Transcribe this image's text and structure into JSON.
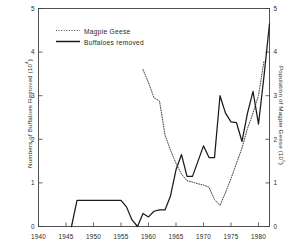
{
  "figure": {
    "background": "#ffffff",
    "frame_color": "#3a3a3a"
  },
  "legend": {
    "geese_label": "Magpie  Geese",
    "buffalo_label": "Buffaloes   removed",
    "geese_style": "dotted",
    "buffalo_style": "solid"
  },
  "axes": {
    "x_ticks": [
      "1940",
      "1945",
      "1950",
      "1955",
      "1960",
      "1965",
      "1970",
      "1975",
      "1980"
    ],
    "y_left_ticks": [
      "0",
      "1",
      "2",
      "3",
      "4",
      "5"
    ],
    "y_right_ticks": [
      "0",
      "1",
      "2",
      "3",
      "4",
      "5"
    ],
    "y_left_title_main": "Numbers  of  Buffaloes  Removed   (10",
    "y_left_title_exp": "4",
    "y_left_title_tail": ")",
    "y_right_title_main": "Population  of  Magpie  Geese   (10",
    "y_right_title_exp": "5",
    "y_right_title_tail": ")"
  },
  "chart_data": {
    "type": "line",
    "title": "",
    "xlabel": "",
    "ylabel": "Numbers of Buffaloes Removed (10^4)",
    "ylabel_right": "Population of Magpie Geese (10^5)",
    "xlim": [
      1940,
      1982
    ],
    "ylim": [
      0,
      5
    ],
    "ylim_right": [
      0,
      5
    ],
    "grid": false,
    "legend_position": "top-left",
    "series": [
      {
        "name": "Buffaloes removed",
        "axis": "left",
        "style": "solid",
        "color": "#1a1a1a",
        "units": "10^4 animals",
        "x": [
          1946,
          1947,
          1948,
          1949,
          1950,
          1951,
          1952,
          1953,
          1954,
          1955,
          1956,
          1957,
          1958,
          1959,
          1960,
          1961,
          1962,
          1963,
          1964,
          1965,
          1966,
          1967,
          1968,
          1969,
          1970,
          1971,
          1972,
          1973,
          1974,
          1975,
          1976,
          1977,
          1978,
          1979,
          1980,
          1981,
          1982
        ],
        "values": [
          0.0,
          0.6,
          0.6,
          0.6,
          0.6,
          0.6,
          0.6,
          0.6,
          0.6,
          0.6,
          0.45,
          0.15,
          0.0,
          0.3,
          0.22,
          0.35,
          0.38,
          0.38,
          0.7,
          1.3,
          1.65,
          1.15,
          1.15,
          1.5,
          1.85,
          1.58,
          1.58,
          3.0,
          2.6,
          2.4,
          2.38,
          1.95,
          2.6,
          3.1,
          2.35,
          3.45,
          4.65
        ]
      },
      {
        "name": "Magpie Geese",
        "axis": "right",
        "style": "dotted",
        "color": "#2b2b2b",
        "units": "10^5 birds",
        "x": [
          1959,
          1960,
          1961,
          1962,
          1963,
          1964,
          1965,
          1966,
          1967,
          1968,
          1969,
          1970,
          1971,
          1972,
          1973,
          1974,
          1975,
          1976,
          1977,
          1978,
          1979,
          1980,
          1981
        ],
        "values": [
          3.6,
          3.3,
          2.95,
          2.88,
          2.1,
          1.75,
          1.45,
          1.2,
          1.05,
          1.02,
          0.98,
          0.95,
          0.9,
          0.62,
          0.48,
          0.78,
          1.1,
          1.45,
          1.8,
          2.25,
          2.6,
          3.0,
          3.8
        ]
      }
    ],
    "annotations": [
      {
        "text": "Magpie  Geese",
        "kind": "legend-entry"
      },
      {
        "text": "Buffaloes   removed",
        "kind": "legend-entry"
      }
    ]
  }
}
